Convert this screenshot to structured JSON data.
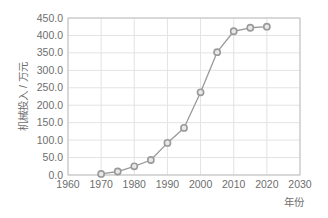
{
  "chart_data": {
    "type": "line",
    "title": "",
    "subtitle": "",
    "xlabel": "年份",
    "ylabel": "机械投入 / 万元",
    "x": [
      1970,
      1975,
      1980,
      1985,
      1990,
      1995,
      2000,
      2005,
      2010,
      2015,
      2020
    ],
    "values": [
      3,
      10,
      25,
      43,
      92,
      135,
      237,
      352,
      412,
      422,
      425
    ],
    "series": [
      {
        "name": "机械投入",
        "values": [
          3,
          10,
          25,
          43,
          92,
          135,
          237,
          352,
          412,
          422,
          425
        ]
      }
    ],
    "xlim": [
      1960,
      2030
    ],
    "ylim": [
      0,
      450
    ],
    "xticks": [
      1960,
      1970,
      1980,
      1990,
      2000,
      2010,
      2020,
      2030
    ],
    "xtick_labels": [
      "1960",
      "1970",
      "1980",
      "1990",
      "2000",
      "2010",
      "2020",
      "2030"
    ],
    "yticks": [
      0,
      50,
      100,
      150,
      200,
      250,
      300,
      350,
      400,
      450
    ],
    "ytick_labels": [
      "0.0",
      "50.0",
      "100.0",
      "150.0",
      "200.0",
      "250.0",
      "300.0",
      "350.0",
      "400.0",
      "450.0"
    ],
    "grid": true,
    "legend": false,
    "legend_position": "none",
    "annotations": [],
    "colors": {
      "line": "#9a9a9a",
      "marker_edge": "#9a9a9a",
      "marker_face": "#e8e8e8",
      "grid": "#e3e3e3",
      "frame": "#bfbfbf",
      "text": "#6e6e6e",
      "background": "#ffffff"
    },
    "marker": "circle",
    "line_width": 1.3,
    "marker_size": 5
  }
}
